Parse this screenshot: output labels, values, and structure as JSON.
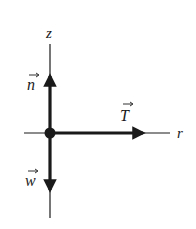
{
  "diagram": {
    "axes": {
      "vertical_label": "z",
      "horizontal_label": "r"
    },
    "vectors": [
      {
        "id": "n",
        "label": "n",
        "direction": "up",
        "description": "normal force"
      },
      {
        "id": "w",
        "label": "w",
        "direction": "down",
        "description": "weight"
      },
      {
        "id": "T",
        "label": "T",
        "direction": "right",
        "description": "tension"
      }
    ],
    "colors": {
      "ink": "#1a1a1a",
      "background": "#ffffff"
    }
  }
}
